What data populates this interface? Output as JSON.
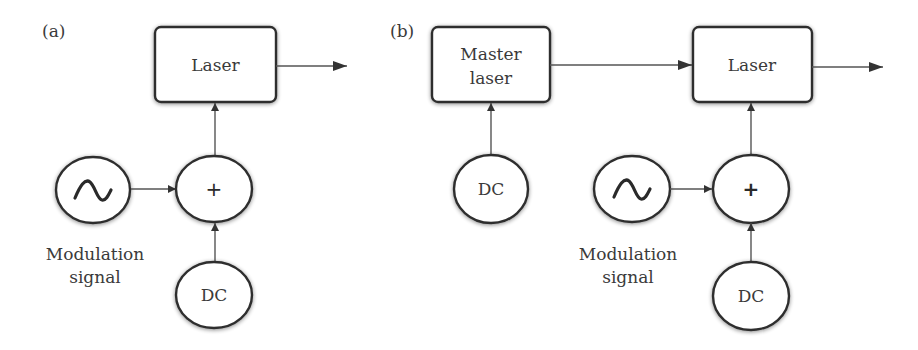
{
  "figure": {
    "panels": [
      {
        "id": "a",
        "label": "(a)",
        "laser": {
          "label": "Laser"
        },
        "summer": {
          "symbol": "+"
        },
        "modulation_source": {
          "icon": "sine-wave-icon",
          "caption_line1": "Modulation",
          "caption_line2": "signal"
        },
        "dc_source": {
          "label": "DC"
        }
      },
      {
        "id": "b",
        "label": "(b)",
        "master_laser": {
          "label_line1": "Master",
          "label_line2": "laser"
        },
        "master_dc_source": {
          "label": "DC"
        },
        "laser": {
          "label": "Laser"
        },
        "summer": {
          "symbol": "+"
        },
        "modulation_source": {
          "icon": "sine-wave-icon",
          "caption_line1": "Modulation",
          "caption_line2": "signal"
        },
        "dc_source": {
          "label": "DC"
        }
      }
    ],
    "colors": {
      "stroke": "#2e2e2e",
      "connector": "#555555",
      "text": "#3a3a3a",
      "background": "#ffffff"
    }
  }
}
